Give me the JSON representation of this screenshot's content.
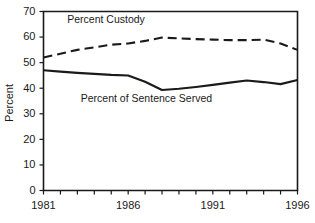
{
  "chart_data": {
    "type": "line",
    "title": "",
    "xlabel": "",
    "ylabel": "Percent",
    "ylim": [
      0,
      70
    ],
    "xlim": [
      1981,
      1996
    ],
    "grid": false,
    "legend_position": "inline-annotation",
    "ytick_labels": [
      "70",
      "60",
      "50",
      "40",
      "30",
      "20",
      "10",
      "0"
    ],
    "ytick_values": [
      70,
      60,
      50,
      40,
      30,
      20,
      10,
      0
    ],
    "xtick_values": [
      1981,
      1982,
      1983,
      1984,
      1985,
      1986,
      1987,
      1988,
      1989,
      1990,
      1991,
      1992,
      1993,
      1994,
      1995,
      1996
    ],
    "xtick_labels": [
      "1981",
      "",
      "",
      "",
      "",
      "1986",
      "",
      "",
      "",
      "",
      "1991",
      "",
      "",
      "",
      "",
      "1996"
    ],
    "xtick_labeled": [
      "1981",
      "1986",
      "1991",
      "1996"
    ],
    "x": [
      1981,
      1982,
      1983,
      1984,
      1985,
      1986,
      1987,
      1988,
      1989,
      1990,
      1991,
      1992,
      1993,
      1994,
      1995,
      1996
    ],
    "series": [
      {
        "name": "Percent Custody",
        "style": "dashed",
        "color": "#1a1a1a",
        "values": [
          52,
          53.5,
          55,
          56,
          57,
          57.5,
          58.5,
          59.8,
          59.5,
          59.2,
          59,
          58.8,
          58.8,
          59,
          57.5,
          55
        ]
      },
      {
        "name": "Percent of Sentence Served",
        "style": "solid",
        "color": "#1a1a1a",
        "values": [
          47,
          46.5,
          46,
          45.6,
          45.2,
          45,
          42.5,
          39.3,
          39.8,
          40.5,
          41.3,
          42.2,
          43,
          42.4,
          41.6,
          43.2
        ]
      }
    ],
    "annotations": [
      {
        "text": "Percent Custody",
        "x": 1982.4,
        "y": 65.5
      },
      {
        "text": "Percent of Sentence Served",
        "x": 1983.2,
        "y": 34.5
      }
    ]
  }
}
